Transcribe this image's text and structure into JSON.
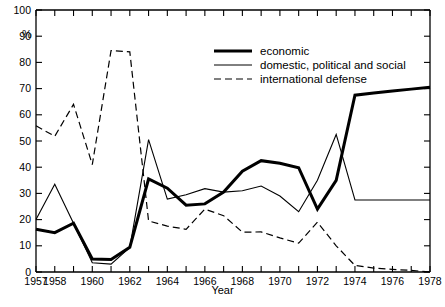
{
  "chart_data": {
    "type": "line",
    "title": "",
    "xlabel": "Year",
    "ylabel": "%",
    "xlim": [
      1957,
      1978
    ],
    "ylim": [
      0,
      100
    ],
    "grid": false,
    "legend_position": "top-right",
    "x": [
      1957,
      1958,
      1959,
      1960,
      1961,
      1962,
      1963,
      1964,
      1965,
      1966,
      1967,
      1968,
      1969,
      1970,
      1971,
      1972,
      1973,
      1974,
      1975,
      1976,
      1977,
      1978
    ],
    "y_ticks": [
      0,
      10,
      20,
      30,
      40,
      50,
      60,
      70,
      80,
      90,
      100
    ],
    "x_ticks": [
      1957,
      1958,
      1959,
      1960,
      1961,
      1962,
      1963,
      1964,
      1965,
      1966,
      1967,
      1968,
      1969,
      1970,
      1971,
      1972,
      1973,
      1974,
      1975,
      1976,
      1977,
      1978
    ],
    "x_tick_labels": [
      "1957",
      "1958",
      "",
      "1960",
      "",
      "1962",
      "",
      "1964",
      "",
      "1966",
      "",
      "1968",
      "",
      "1970",
      "",
      "1972",
      "",
      "1974",
      "",
      "1976",
      "",
      "1978"
    ],
    "series": [
      {
        "name": "economic",
        "style": "thick-solid",
        "values": [
          16.3,
          15.0,
          18.6,
          5.0,
          4.8,
          9.4,
          35.5,
          32.0,
          25.5,
          26.0,
          30.5,
          38.5,
          42.5,
          41.5,
          39.8,
          24.0,
          35.0,
          67.5,
          68.3,
          69.1,
          69.8,
          70.5
        ]
      },
      {
        "name": "domestic, political and social",
        "style": "thin-solid",
        "values": [
          20.0,
          33.5,
          18.6,
          3.5,
          3.0,
          9.4,
          50.5,
          27.8,
          29.5,
          31.8,
          30.5,
          31.0,
          32.8,
          29.0,
          23.0,
          35.0,
          52.5,
          27.5,
          27.5,
          27.5,
          27.5,
          27.5
        ]
      },
      {
        "name": "international defense",
        "style": "dashed",
        "values": [
          55.8,
          51.8,
          64.0,
          41.0,
          84.5,
          84.0,
          19.5,
          17.5,
          16.3,
          24.0,
          21.5,
          15.2,
          15.3,
          13.0,
          11.0,
          19.0,
          10.0,
          2.5,
          1.5,
          1.0,
          0.6,
          0.0
        ]
      }
    ]
  },
  "legend": {
    "items": [
      {
        "label": "economic",
        "key": "thick-solid"
      },
      {
        "label": "domestic, political and social",
        "key": "thin-solid"
      },
      {
        "label": "international defense",
        "key": "dashed"
      }
    ]
  },
  "axes": {
    "y_title": "%",
    "x_title": "Year"
  }
}
